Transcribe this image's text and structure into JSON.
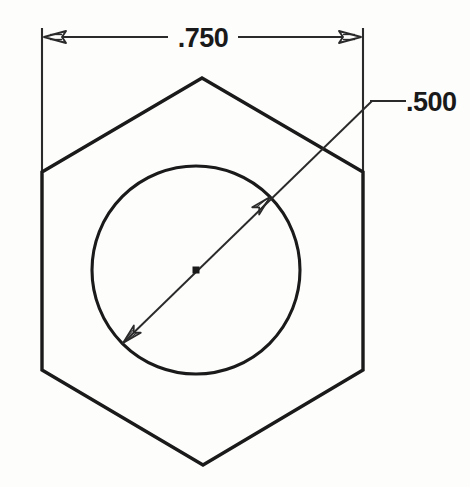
{
  "drawing": {
    "title": "Hex nut orthographic view",
    "background_color": "#fdfdfc",
    "line_color": "#1a1a1a",
    "units": "inches"
  },
  "dimensions": {
    "width_across_flats": {
      "label": ".750",
      "icon": "linear-dimension-icon",
      "type": "linear",
      "orientation": "horizontal",
      "arrow_style": "open-outline",
      "extension_line_left_x": 42,
      "extension_line_right_x": 363,
      "dimension_line_y": 37
    },
    "hole_diameter": {
      "label": ".500",
      "icon": "diameter-dimension-icon",
      "type": "diameter",
      "orientation": "diagonal",
      "arrow_style": "open-outline",
      "leader_shoulder_y": 101,
      "leader_text_x": 407
    }
  },
  "geometry": {
    "hexagon": {
      "name": "hex-outline",
      "center_x": 202,
      "center_y": 271,
      "vertices": "42,172 202,78 363,172 363,370 203,465 42,370",
      "stroke_width": 3.2
    },
    "circle": {
      "name": "bore-circle",
      "center_x": 196,
      "center_y": 270,
      "radius": 104,
      "stroke_width": 3.0
    },
    "center_mark": {
      "name": "center-point",
      "x": 196,
      "y": 270,
      "size": 7
    }
  },
  "annotations": {
    "width_value": ".750",
    "diameter_value": ".500"
  }
}
